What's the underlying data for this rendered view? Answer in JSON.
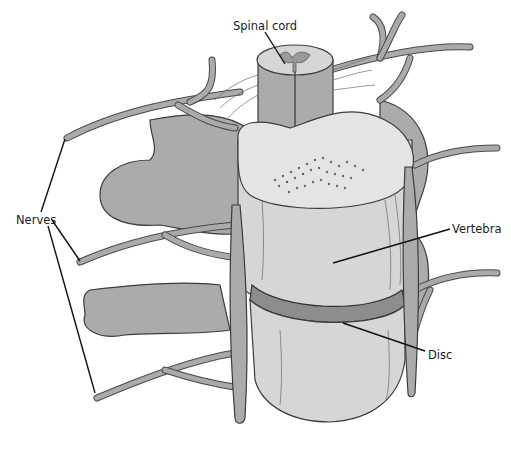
{
  "diagram": {
    "labels": [
      {
        "id": "spinal-cord",
        "text": "Spinal cord"
      },
      {
        "id": "nerves",
        "text": "Nerves"
      },
      {
        "id": "vertebra",
        "text": "Vertebra"
      },
      {
        "id": "disc",
        "text": "Disc"
      }
    ],
    "colors": {
      "background": "#ffffff",
      "tissue_gray": "#ababab",
      "vertebra_light": "#d6d6d6",
      "vertebra_top": "#e4e4e4",
      "disc": "#8d8d8d",
      "outline": "#3c3c3c",
      "leader_line": "#111111"
    }
  }
}
